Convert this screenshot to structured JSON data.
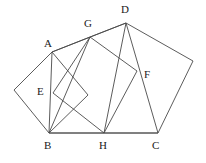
{
  "figure": {
    "stroke_color": "#4a4a4a",
    "label_color": "#1a1a1a",
    "background": "#ffffff",
    "width": 206,
    "height": 163,
    "points": {
      "A": {
        "x": 52,
        "y": 52
      },
      "B": {
        "x": 49,
        "y": 133
      },
      "C": {
        "x": 158,
        "y": 133
      },
      "D": {
        "x": 126,
        "y": 23
      },
      "E": {
        "x": 53,
        "y": 93
      },
      "F": {
        "x": 137,
        "y": 71
      },
      "G": {
        "x": 90,
        "y": 37
      },
      "H": {
        "x": 104,
        "y": 133
      },
      "P_left": {
        "x": 14,
        "y": 90
      },
      "P_right": {
        "x": 193,
        "y": 61
      },
      "Q_sq1": {
        "x": 88,
        "y": 95
      }
    },
    "labels": [
      {
        "key": "A",
        "text": "A",
        "x": 44,
        "y": 38
      },
      {
        "key": "B",
        "text": "B",
        "x": 44,
        "y": 140
      },
      {
        "key": "C",
        "text": "C",
        "x": 152,
        "y": 140
      },
      {
        "key": "D",
        "text": "D",
        "x": 121,
        "y": 4
      },
      {
        "key": "E",
        "text": "E",
        "x": 37,
        "y": 86
      },
      {
        "key": "F",
        "text": "F",
        "x": 144,
        "y": 69
      },
      {
        "key": "G",
        "text": "G",
        "x": 84,
        "y": 18
      },
      {
        "key": "H",
        "text": "H",
        "x": 99,
        "y": 140
      }
    ],
    "shapes": [
      {
        "name": "outer-pentagon",
        "closed": true,
        "vertices": [
          "A",
          "D",
          "P_right",
          "C",
          "B"
        ]
      },
      {
        "name": "square-left-ABE",
        "closed": true,
        "vertices": [
          "A",
          "P_left",
          "B",
          "Q_sq1"
        ]
      },
      {
        "name": "square-right-GFH",
        "closed": true,
        "vertices": [
          "G",
          "F",
          "H",
          "E"
        ]
      },
      {
        "name": "segment-D-to-H",
        "closed": false,
        "vertices": [
          "D",
          "H"
        ]
      },
      {
        "name": "segment-G-to-B",
        "closed": false,
        "vertices": [
          "G",
          "B"
        ]
      },
      {
        "name": "segment-D-to-G",
        "closed": false,
        "vertices": [
          "D",
          "G"
        ]
      },
      {
        "name": "segment-B-to-C",
        "closed": false,
        "vertices": [
          "B",
          "C"
        ]
      },
      {
        "name": "segment-A-to-G",
        "closed": false,
        "vertices": [
          "A",
          "G"
        ]
      },
      {
        "name": "segment-C-to-D",
        "closed": false,
        "vertices": [
          "C",
          "D"
        ]
      }
    ]
  }
}
